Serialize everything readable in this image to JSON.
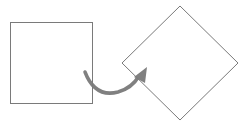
{
  "diagram": {
    "type": "rotation-illustration",
    "shapes": [
      {
        "id": "square",
        "kind": "square",
        "rotation_deg": 0,
        "stroke": "#7a7a7a"
      },
      {
        "id": "diamond",
        "kind": "square",
        "rotation_deg": 45,
        "stroke": "#7a7a7a"
      }
    ],
    "arrow": {
      "from": "square",
      "to": "diamond",
      "style": "curved",
      "color": "#808080"
    },
    "colors": {
      "background": "#ffffff",
      "shape_stroke": "#7a7a7a",
      "arrow": "#808080"
    }
  }
}
